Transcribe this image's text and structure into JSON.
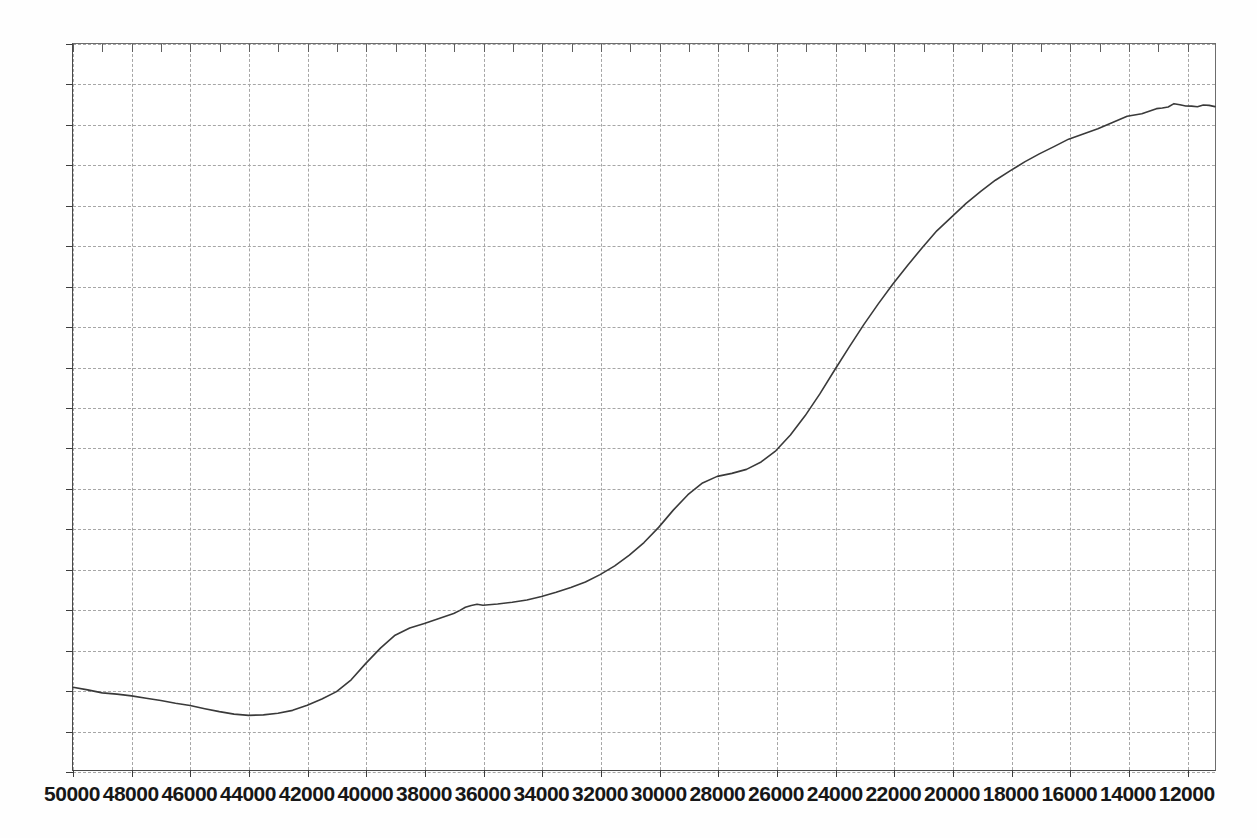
{
  "chart_data": {
    "type": "line",
    "title": "",
    "subtitle": "",
    "xlabel": "",
    "ylabel": "",
    "xlim": [
      50000,
      11000
    ],
    "ylim": [
      0,
      90
    ],
    "x_inverted": true,
    "grid": true,
    "legend": null,
    "legend_position": "none",
    "line_color": "#3a3a3a",
    "grid_color": "#a6a6a6",
    "axis_color": "#3d3d3d",
    "background": "#ffffff",
    "xticks": [
      50000,
      48000,
      46000,
      44000,
      42000,
      40000,
      38000,
      36000,
      34000,
      32000,
      30000,
      28000,
      26000,
      24000,
      22000,
      20000,
      18000,
      16000,
      14000,
      12000
    ],
    "xtick_labels": [
      "50000",
      "48000",
      "46000",
      "44000",
      "42000",
      "40000",
      "38000",
      "36000",
      "34000",
      "32000",
      "30000",
      "28000",
      "26000",
      "24000",
      "22000",
      "20000",
      "18000",
      "16000",
      "14000",
      "12000"
    ],
    "yticks": [
      0,
      5,
      10,
      15,
      20,
      25,
      30,
      35,
      40,
      45,
      50,
      55,
      60,
      65,
      70,
      75,
      80,
      85,
      90
    ],
    "ytick_labels": [
      "0",
      "5",
      "10",
      "15",
      "20",
      "25",
      "30",
      "35",
      "40",
      "45",
      "50",
      "55",
      "60",
      "65",
      "70",
      "75",
      "80",
      "85",
      "90"
    ],
    "series": [
      {
        "name": "trace-1",
        "x": [
          50000,
          49500,
          49000,
          48500,
          48000,
          47500,
          47000,
          46500,
          46000,
          45500,
          45000,
          44500,
          44000,
          43500,
          43000,
          42500,
          42000,
          41500,
          41000,
          40500,
          40000,
          39500,
          39000,
          38500,
          38000,
          37500,
          37000,
          36800,
          36600,
          36400,
          36200,
          36000,
          35500,
          35000,
          34500,
          34000,
          33500,
          33000,
          32500,
          32000,
          31500,
          31000,
          30500,
          30000,
          29500,
          29000,
          28500,
          28000,
          27500,
          27000,
          26500,
          26000,
          25500,
          25000,
          24500,
          24000,
          23500,
          23000,
          22500,
          22000,
          21500,
          21000,
          20500,
          20000,
          19500,
          19000,
          18500,
          18000,
          17500,
          17000,
          16500,
          16000,
          15500,
          15000,
          14500,
          14000,
          13500,
          13000,
          12800,
          12600,
          12400,
          12200,
          12000,
          11800,
          11600,
          11400,
          11200,
          11000
        ],
        "y": [
          10.3,
          9.9,
          9.6,
          9.4,
          9.2,
          8.9,
          8.6,
          8.3,
          8.0,
          7.6,
          7.2,
          6.9,
          6.8,
          6.8,
          7.0,
          7.4,
          8.0,
          8.8,
          9.7,
          11.2,
          13.2,
          15.1,
          16.7,
          17.6,
          18.2,
          18.8,
          19.4,
          19.8,
          20.2,
          20.4,
          20.5,
          20.4,
          20.6,
          20.8,
          21.1,
          21.5,
          22.0,
          22.6,
          23.3,
          24.2,
          25.3,
          26.6,
          28.2,
          30.1,
          32.2,
          34.1,
          35.6,
          36.4,
          36.8,
          37.3,
          38.2,
          39.6,
          41.5,
          43.9,
          46.6,
          49.5,
          52.4,
          55.2,
          57.8,
          60.3,
          62.6,
          64.8,
          66.8,
          68.6,
          70.3,
          71.8,
          73.1,
          74.3,
          75.4,
          76.4,
          77.3,
          78.2,
          79.0,
          79.7,
          80.4,
          81.0,
          81.5,
          81.9,
          82.2,
          82.4,
          82.5,
          82.5,
          82.5,
          82.4,
          82.4,
          82.5,
          82.4,
          82.3
        ]
      }
    ],
    "annotations": []
  },
  "axes": {
    "x_axis_name": "x-axis",
    "y_axis_name": "y-axis"
  }
}
